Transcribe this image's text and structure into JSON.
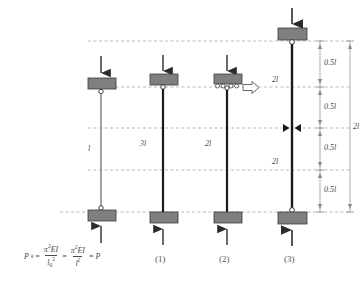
{
  "figure": {
    "background_color": "#ffffff",
    "block_color": "#7f7f7f",
    "block_stroke": "#3a3a3a",
    "column_color": "#1a1a1a",
    "column_light_color": "#8a8a8a",
    "dashed_color": "#9a8fa0",
    "dim_color": "#8d8d8d",
    "text_color": "#4a4a4a"
  },
  "columns": [
    {
      "id": "col-0",
      "label": "",
      "length_label": "l",
      "top_load_arrow": "down-arrow",
      "bottom_load_arrow": "up-arrow",
      "top_support": "pin",
      "bottom_support": "pin",
      "side_force": false
    },
    {
      "id": "col-1",
      "label": "(1)",
      "length_label": "3l",
      "top_load_arrow": "down-arrow",
      "bottom_load_arrow": "up-arrow",
      "top_support": "pin",
      "bottom_support": "fixed",
      "side_force": false
    },
    {
      "id": "col-2",
      "label": "(2)",
      "length_label": "2l",
      "top_load_arrow": "down-arrow",
      "bottom_load_arrow": "up-arrow",
      "top_support": "roller",
      "bottom_support": "fixed",
      "side_force": true,
      "side_force_arrow": "right-hollow-arrow"
    },
    {
      "id": "col-3",
      "label": "(3)",
      "length_label_upper": "2l",
      "length_label_lower": "2l",
      "top_load_arrow": "down-arrow",
      "bottom_load_arrow": "up-arrow",
      "top_support": "pin",
      "bottom_support": "pin",
      "inflection_marker": "bowtie-hinge",
      "side_force": false
    }
  ],
  "dimensions": {
    "segments": [
      {
        "label": "0.5l"
      },
      {
        "label": "0.5l"
      },
      {
        "label": "0.5l"
      },
      {
        "label": "0.5l"
      }
    ],
    "overall": {
      "label": "2l"
    }
  },
  "formula": {
    "lhs_symbol": "P",
    "lhs_subscript": "k",
    "equals_1": "=",
    "frac1_numerator_pi": "π",
    "frac1_numerator_exp": "2",
    "frac1_numerator_EI": "EI",
    "frac1_denominator_l": "l",
    "frac1_denominator_sub": "0",
    "frac1_denominator_exp": "2",
    "equals_2": "=",
    "frac2_numerator_pi": "π",
    "frac2_numerator_exp": "2",
    "frac2_numerator_EI": "EI",
    "frac2_denominator_l": "l",
    "frac2_denominator_exp": "2",
    "equals_3": "=",
    "result": "P"
  }
}
